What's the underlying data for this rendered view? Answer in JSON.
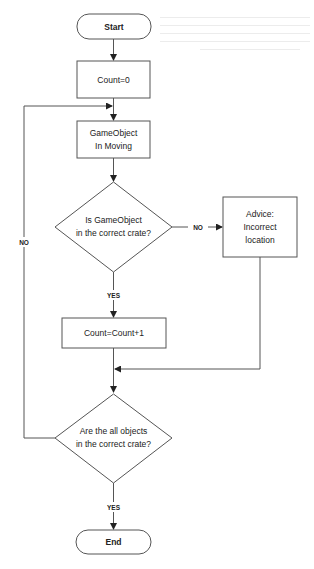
{
  "diagram": {
    "type": "flowchart",
    "stroke_color": "#555555",
    "text_color": "#222222",
    "nodes": {
      "start": {
        "shape": "terminal",
        "label": "Start"
      },
      "init": {
        "shape": "process",
        "label": "Count=0"
      },
      "moving": {
        "shape": "process",
        "lines": [
          "GameObject",
          "In Moving"
        ]
      },
      "check_crate": {
        "shape": "decision",
        "lines": [
          "Is GameObject",
          "in the correct crate?"
        ]
      },
      "advice": {
        "shape": "process",
        "lines": [
          "Advice:",
          "Incorrect",
          "location"
        ]
      },
      "increment": {
        "shape": "process",
        "label": "Count=Count+1"
      },
      "check_all": {
        "shape": "decision",
        "lines": [
          "Are the all objects",
          "in the correct crate?"
        ]
      },
      "end": {
        "shape": "terminal",
        "label": "End"
      }
    },
    "edges": [
      {
        "from": "start",
        "to": "init",
        "label": ""
      },
      {
        "from": "init",
        "to": "moving",
        "label": ""
      },
      {
        "from": "moving",
        "to": "check_crate",
        "label": ""
      },
      {
        "from": "check_crate",
        "to": "advice",
        "label": "NO"
      },
      {
        "from": "check_crate",
        "to": "increment",
        "label": "YES"
      },
      {
        "from": "advice",
        "to": "check_all",
        "label": ""
      },
      {
        "from": "increment",
        "to": "check_all",
        "label": ""
      },
      {
        "from": "check_all",
        "to": "moving",
        "label": "NO"
      },
      {
        "from": "check_all",
        "to": "end",
        "label": "YES"
      }
    ]
  }
}
